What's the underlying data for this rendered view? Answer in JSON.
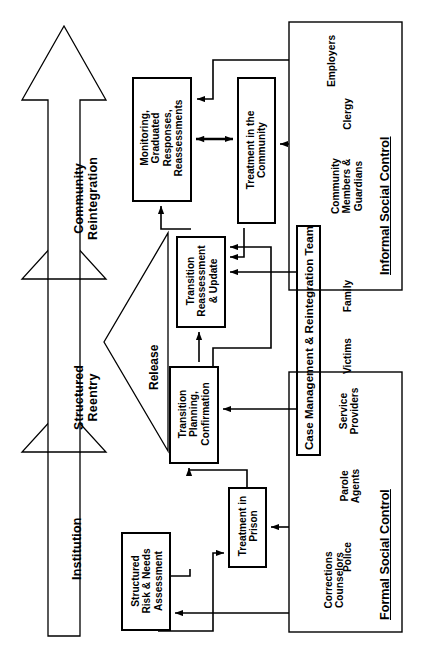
{
  "diagram": {
    "orientation": "rotated-90-ccw",
    "stages": [
      {
        "id": "institution",
        "label": "Institution"
      },
      {
        "id": "structured-reentry",
        "label": "Structured\nReentry"
      },
      {
        "id": "community-reintegration",
        "label": "Community\nReintegration"
      }
    ],
    "transition_arrow": {
      "id": "release",
      "label": "Release"
    },
    "process_boxes": [
      {
        "id": "structured-risk-needs-assessment",
        "label": "Structured\nRisk & Needs\nAssessment"
      },
      {
        "id": "treatment-in-prison",
        "label": "Treatment in\nPrison"
      },
      {
        "id": "transition-planning-confirmation",
        "label": "Transition\nPlanning,\nConfirmation"
      },
      {
        "id": "transition-reassessment-update",
        "label": "Transition\nReassessment\n& Update"
      },
      {
        "id": "monitoring-graduated-responses-reassessments",
        "label": "Monitoring,\nGraduated\nResponses,\nReassessments"
      },
      {
        "id": "treatment-in-the-community",
        "label": "Treatment in the\nCommunity"
      }
    ],
    "team_box": {
      "id": "case-management-reintegration-team",
      "label": "Case Management & Reintegration Team"
    },
    "control_panels": [
      {
        "id": "formal-social-control",
        "label": "Formal Social Control",
        "actors": [
          {
            "id": "corrections-counselors",
            "label": "Corrections\nCounselors"
          },
          {
            "id": "police",
            "label": "Police"
          },
          {
            "id": "parole-agents",
            "label": "Parole\nAgents"
          },
          {
            "id": "service-providers",
            "label": "Service\nProviders"
          }
        ]
      },
      {
        "id": "informal-social-control",
        "label": "Informal Social Control",
        "actors": [
          {
            "id": "victims",
            "label": "Victims"
          },
          {
            "id": "family",
            "label": "Family"
          },
          {
            "id": "community-members-guardians",
            "label": "Community\nMembers &\nGuardians"
          },
          {
            "id": "clergy",
            "label": "Clergy"
          },
          {
            "id": "employers",
            "label": "Employers"
          }
        ]
      }
    ],
    "colors": {
      "stroke": "#000000",
      "fill": "#ffffff",
      "text": "#000000"
    }
  }
}
